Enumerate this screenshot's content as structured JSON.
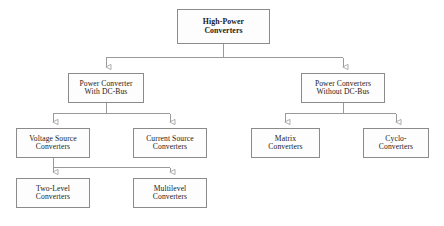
{
  "diagram": {
    "orientation": "top-down",
    "style": {
      "box_border_color": "#8b8b8b",
      "box_fill_color": "#fdfdfd",
      "connector_color": "#9a9a9a",
      "text_color": "#1a1a1a",
      "background_color": "#ffffff"
    },
    "nodes": [
      {
        "id": "root",
        "level": 0,
        "bold": true,
        "line1": "High-Power",
        "line2": "Converters",
        "box": {
          "x": 177,
          "y": 9,
          "w": 93,
          "h": 35
        }
      },
      {
        "id": "with-dc-bus",
        "level": 1,
        "bold": false,
        "line1": "Power Converter",
        "line2": "With DC-Bus",
        "box": {
          "x": 68,
          "y": 73,
          "w": 76,
          "h": 30
        }
      },
      {
        "id": "without-dc-bus",
        "level": 1,
        "bold": false,
        "line1": "Power Converters",
        "line2": "Without DC-Bus",
        "box": {
          "x": 301,
          "y": 73,
          "w": 84,
          "h": 30
        }
      },
      {
        "id": "voltage-source-converters",
        "level": 2,
        "bold": false,
        "line1": "Voltage Source",
        "line2": "Converters",
        "box": {
          "x": 16,
          "y": 128,
          "w": 74,
          "h": 30
        }
      },
      {
        "id": "current-source-converters",
        "level": 2,
        "bold": false,
        "line1": "Current Source",
        "line2": "Converters",
        "box": {
          "x": 133,
          "y": 128,
          "w": 74,
          "h": 30
        }
      },
      {
        "id": "matrix-converters",
        "level": 2,
        "bold": false,
        "line1": "Matrix",
        "line2": "Converters",
        "box": {
          "x": 251,
          "y": 128,
          "w": 69,
          "h": 30
        }
      },
      {
        "id": "cyclo-converters",
        "level": 2,
        "bold": false,
        "line1": "Cyclo-",
        "line2": "Converters",
        "box": {
          "x": 363,
          "y": 128,
          "w": 66,
          "h": 30
        }
      },
      {
        "id": "two-level-converters",
        "level": 3,
        "bold": false,
        "line1": "Two-Level",
        "line2": "Converters",
        "box": {
          "x": 16,
          "y": 178,
          "w": 74,
          "h": 30
        }
      },
      {
        "id": "multilevel-converters",
        "level": 3,
        "bold": false,
        "line1": "Multilevel",
        "line2": "Converters",
        "box": {
          "x": 133,
          "y": 178,
          "w": 74,
          "h": 30
        }
      }
    ],
    "edges": [
      {
        "id": "root-to-with-dc-bus",
        "from": "root",
        "to": "with-dc-bus",
        "arrow": "open-triangle"
      },
      {
        "id": "root-to-without-dc-bus",
        "from": "root",
        "to": "without-dc-bus",
        "arrow": "open-triangle"
      },
      {
        "id": "with-dc-bus-to-voltage-source",
        "from": "with-dc-bus",
        "to": "voltage-source-converters",
        "arrow": "open-triangle"
      },
      {
        "id": "with-dc-bus-to-current-source",
        "from": "with-dc-bus",
        "to": "current-source-converters",
        "arrow": "open-triangle"
      },
      {
        "id": "without-dc-bus-to-matrix",
        "from": "without-dc-bus",
        "to": "matrix-converters",
        "arrow": "open-triangle"
      },
      {
        "id": "without-dc-bus-to-cyclo",
        "from": "without-dc-bus",
        "to": "cyclo-converters",
        "arrow": "open-triangle"
      },
      {
        "id": "voltage-source-to-two-level",
        "from": "voltage-source-converters",
        "to": "two-level-converters",
        "arrow": "open-triangle"
      },
      {
        "id": "voltage-source-to-multilevel",
        "from": "voltage-source-converters",
        "to": "multilevel-converters",
        "arrow": "open-triangle"
      }
    ]
  }
}
